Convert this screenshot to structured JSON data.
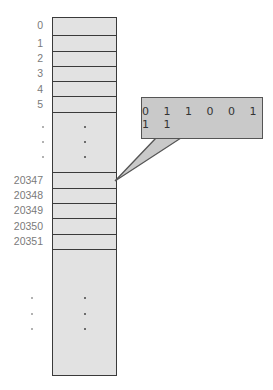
{
  "diagram": {
    "type": "memory-layout",
    "top_addresses": [
      "0",
      "1",
      "2",
      "3",
      "4",
      "5"
    ],
    "middle_ellipsis": [
      ".",
      ".",
      "."
    ],
    "mid_addresses": [
      "20347",
      "20348",
      "20349",
      "20350",
      "20351"
    ],
    "bottom_ellipsis": [
      ".",
      ".",
      "."
    ],
    "callout": {
      "bits": "0 1 1 0 0 1 1 1",
      "points_to_address": "20347"
    },
    "colors": {
      "cell_fill": "#e2e2e2",
      "border": "#3a3a3a",
      "callout_fill": "#c9c9c9",
      "address_text": "#7a7a7a"
    }
  }
}
